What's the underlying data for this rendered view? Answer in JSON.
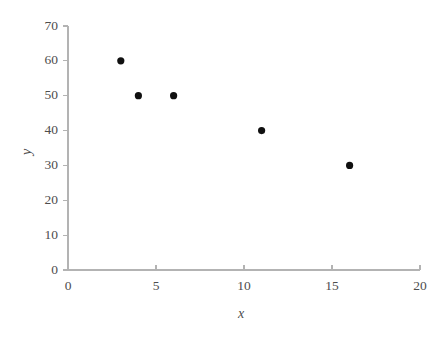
{
  "chart_data": {
    "type": "scatter",
    "title": "",
    "xlabel": "x",
    "ylabel": "y",
    "xlim": [
      0,
      20
    ],
    "ylim": [
      0,
      70
    ],
    "xticks": [
      0,
      5,
      10,
      15,
      20
    ],
    "yticks": [
      0,
      10,
      20,
      30,
      40,
      50,
      60,
      70
    ],
    "xtick_labels": [
      "0",
      "5",
      "10",
      "15",
      "20"
    ],
    "ytick_labels": [
      "0",
      "10",
      "20",
      "30",
      "40",
      "50",
      "60",
      "70"
    ],
    "grid": false,
    "legend": null,
    "series": [
      {
        "name": "",
        "marker": "filled-circle",
        "color": "#101010",
        "points": [
          {
            "x": 3,
            "y": 60
          },
          {
            "x": 4,
            "y": 50
          },
          {
            "x": 6,
            "y": 50
          },
          {
            "x": 11,
            "y": 40
          },
          {
            "x": 16,
            "y": 30
          }
        ]
      }
    ],
    "style": {
      "axis_color": "#b3b3b3",
      "tick_label_color": "#4d4d4d",
      "marker_radius_px": 3.6,
      "background": "#ffffff"
    },
    "geometry": {
      "plot_left_px": 68,
      "plot_right_px": 420,
      "plot_bottom_px": 270,
      "plot_top_px": 26,
      "tick_len_px": 5
    }
  }
}
